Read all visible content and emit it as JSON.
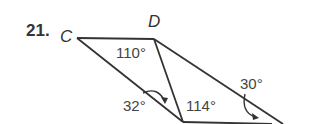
{
  "problem": {
    "number": "21."
  },
  "figure": {
    "type": "geometry-triangles",
    "vertices": {
      "C": "C",
      "D": "D"
    },
    "angles": {
      "at_D_in_triangle": "110°",
      "lower_left": "32°",
      "bottom_vertex": "114°",
      "right": "30°"
    },
    "colors": {
      "stroke": "#333333",
      "text": "#3a3a3a"
    }
  }
}
